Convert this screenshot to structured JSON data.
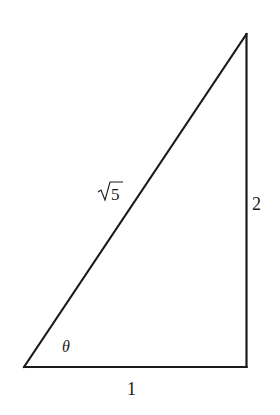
{
  "diagram": {
    "type": "right-triangle",
    "vertices": {
      "bottom_left": [
        24,
        367
      ],
      "bottom_right": [
        246,
        367
      ],
      "top_right": [
        246,
        34
      ]
    },
    "right_angle_at": "bottom_right",
    "stroke_color": "#1a1a1a",
    "labels": {
      "hypotenuse": "√5",
      "hypotenuse_radicand": "5",
      "vertical_side": "2",
      "horizontal_side": "1",
      "angle": "θ"
    }
  }
}
